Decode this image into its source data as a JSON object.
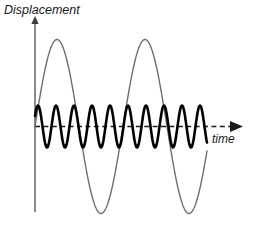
{
  "figure": {
    "title": "",
    "background_color": "#ffffff",
    "width": 254,
    "height": 225
  },
  "axes": {
    "y": {
      "label": "Displacement",
      "color": "#4d4d4d",
      "arrow": "up-arrow-icon"
    },
    "x": {
      "label": "time",
      "color": "#1a1a1a",
      "style": "dashed",
      "arrow": "right-arrow-icon"
    }
  },
  "chart_data": {
    "type": "line",
    "title": "",
    "xlabel": "time",
    "ylabel": "Displacement",
    "xlim": [
      0,
      1
    ],
    "ylim": [
      -1,
      1
    ],
    "grid": false,
    "legend": "none",
    "zero_line": 0,
    "annotations": [],
    "series": [
      {
        "name": "low-frequency-large-amplitude-wave",
        "color": "#6e6e6e",
        "stroke_width": 1.4,
        "waveform": "sine",
        "amplitude": 0.87,
        "cycles": 2.24,
        "phase_deg": 0,
        "x_start_px": 35,
        "x_end_px": 207,
        "peaks_px": [
          57,
          145
        ],
        "troughs_px": [
          99,
          188
        ],
        "amplitude_px": 87,
        "wavelength_px": 88
      },
      {
        "name": "high-frequency-small-amplitude-wave",
        "color": "#000000",
        "stroke_width": 2.6,
        "waveform": "sine",
        "amplitude": 0.21,
        "cycles": 9.5,
        "phase_deg": 0,
        "x_start_px": 35,
        "x_end_px": 207,
        "peaks_px": [
          38,
          56,
          74,
          92,
          110,
          128,
          146,
          164,
          182,
          200
        ],
        "amplitude_px": 21,
        "wavelength_px": 18
      }
    ]
  }
}
